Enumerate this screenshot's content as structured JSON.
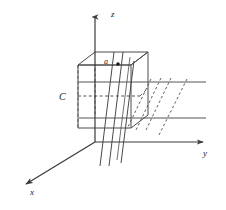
{
  "figure": {
    "background_color": "#ffffff",
    "stroke_color": "#4d4d4d",
    "dark_stroke_color": "#3a3a3a",
    "text_color": "#1a1a1a",
    "width": 226,
    "height": 210
  },
  "axes": {
    "origin": {
      "x": 95,
      "y": 142
    },
    "z": {
      "label": "z",
      "label_x": 111,
      "label_y": 11,
      "from": {
        "x": 95,
        "y": 142
      },
      "to": {
        "x": 95,
        "y": 13
      }
    },
    "y": {
      "label": "y",
      "label_x": 203,
      "label_y": 150,
      "from": {
        "x": 95,
        "y": 142
      },
      "to": {
        "x": 209,
        "y": 142
      }
    },
    "x": {
      "label": "x",
      "label_x": 30,
      "label_y": 189,
      "from": {
        "x": 95,
        "y": 142
      },
      "to": {
        "x": 21,
        "y": 187
      }
    }
  },
  "cube": {
    "label": "C",
    "label_x": 59,
    "label_y": 93,
    "top_face": "95,52 148,52 131,65 78,65",
    "front_face": "78,65 131,65 131,128 78,128",
    "right_face": "131,65 148,52 148,115 131,128",
    "hidden_back_vertical": "95,52 95,115",
    "hidden_bottom_back": "78,96 140,96",
    "hidden_left_vertical": "78,65 78,128"
  },
  "point": {
    "label": "a",
    "label_x": 104,
    "label_y": 59,
    "dot_x": 118,
    "dot_y": 64,
    "dot_r": 1.6
  },
  "slab": {
    "upper_line": {
      "x1": 79,
      "y1": 82,
      "x2": 206,
      "y2": 82
    },
    "lower_line": {
      "x1": 79,
      "y1": 118,
      "x2": 206,
      "y2": 118
    }
  },
  "slanted_planes": {
    "solid": [
      {
        "x1": 113,
        "y1": 52,
        "x2": 100,
        "y2": 166
      },
      {
        "x1": 122,
        "y1": 52,
        "x2": 109,
        "y2": 166
      },
      {
        "x1": 131,
        "y1": 65,
        "x2": 120,
        "y2": 163
      }
    ],
    "dashed": [
      {
        "x1": 161,
        "y1": 78,
        "x2": 136,
        "y2": 130
      },
      {
        "x1": 171,
        "y1": 78,
        "x2": 146,
        "y2": 130
      },
      {
        "x1": 186,
        "y1": 80,
        "x2": 158,
        "y2": 136
      }
    ]
  },
  "legend": {
    "cube_name": "C",
    "point_name": "a",
    "axis_names": [
      "x",
      "y",
      "z"
    ]
  }
}
